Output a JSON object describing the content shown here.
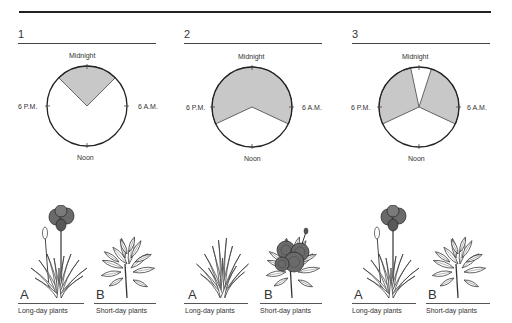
{
  "panels": [
    {
      "number": "1",
      "clock": {
        "top": "Midnight",
        "left": "6 P.M.",
        "right": "6 A.M.",
        "bottom": "Noon"
      },
      "dark_intervals_deg": [
        [
          -45,
          45
        ]
      ],
      "plants": [
        {
          "letter": "A",
          "caption": "Long-day plants",
          "flowering": true
        },
        {
          "letter": "B",
          "caption": "Short-day plants",
          "flowering": false
        }
      ]
    },
    {
      "number": "2",
      "clock": {
        "top": "Midnight",
        "left": "6 P.M.",
        "right": "6 A.M.",
        "bottom": "Noon"
      },
      "dark_intervals_deg": [
        [
          -115,
          115
        ]
      ],
      "plants": [
        {
          "letter": "A",
          "caption": "Long-day plants",
          "flowering": false
        },
        {
          "letter": "B",
          "caption": "Short-day plants",
          "flowering": true
        }
      ]
    },
    {
      "number": "3",
      "clock": {
        "top": "Midnight",
        "left": "6 P.M.",
        "right": "6 A.M.",
        "bottom": "Noon"
      },
      "dark_intervals_deg": [
        [
          -115,
          -12
        ],
        [
          18,
          115
        ]
      ],
      "plants": [
        {
          "letter": "A",
          "caption": "Long-day plants",
          "flowering": true
        },
        {
          "letter": "B",
          "caption": "Short-day plants",
          "flowering": false
        }
      ]
    }
  ],
  "colors": {
    "dark": "#c8c8c8",
    "stroke": "#222222",
    "flower": "#6a6a6a"
  }
}
